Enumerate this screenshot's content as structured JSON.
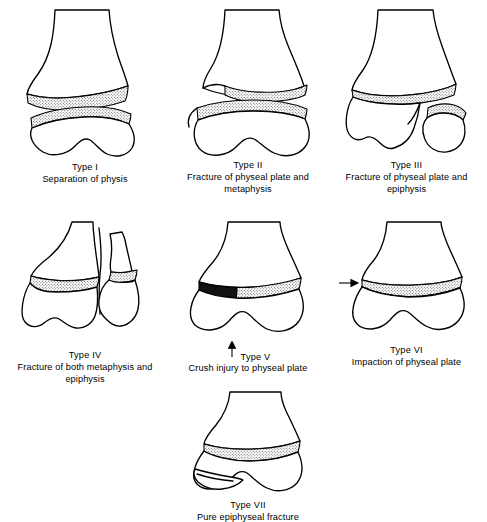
{
  "figure": {
    "background_color": "#ffffff",
    "ink_color": "#000000",
    "physis_fill": "stipple-hatch",
    "crush_fill": "#111111"
  },
  "panels": [
    {
      "id": "type-1",
      "title": "Type I",
      "description": "Separation of physis",
      "description_lines": [
        "Separation of physis"
      ],
      "has_arrow": false
    },
    {
      "id": "type-2",
      "title": "Type II",
      "description": "Fracture of physeal plate and metaphysis",
      "description_lines": [
        "Fracture of physeal plate and",
        "metaphysis"
      ],
      "has_arrow": false
    },
    {
      "id": "type-3",
      "title": "Type III",
      "description": "Fracture of physeal plate and epiphysis",
      "description_lines": [
        "Fracture of physeal plate and",
        "epiphysis"
      ],
      "has_arrow": false
    },
    {
      "id": "type-4",
      "title": "Type IV",
      "description": "Fracture of both metaphysis and epiphysis",
      "description_lines": [
        "Fracture of both metaphysis and",
        "epiphysis"
      ],
      "has_arrow": false
    },
    {
      "id": "type-5",
      "title": "Type V",
      "description": "Crush injury to physeal plate",
      "description_lines": [
        "Crush injury to physeal plate"
      ],
      "has_arrow": true,
      "arrow_direction": "up"
    },
    {
      "id": "type-6",
      "title": "Type VI",
      "description": "Impaction of physeal plate",
      "description_lines": [
        "Impaction of physeal plate"
      ],
      "has_arrow": true,
      "arrow_direction": "right"
    },
    {
      "id": "type-7",
      "title": "Type VII",
      "description": "Pure epiphyseal fracture",
      "description_lines": [
        "Pure epiphyseal fracture"
      ],
      "has_arrow": false
    }
  ]
}
